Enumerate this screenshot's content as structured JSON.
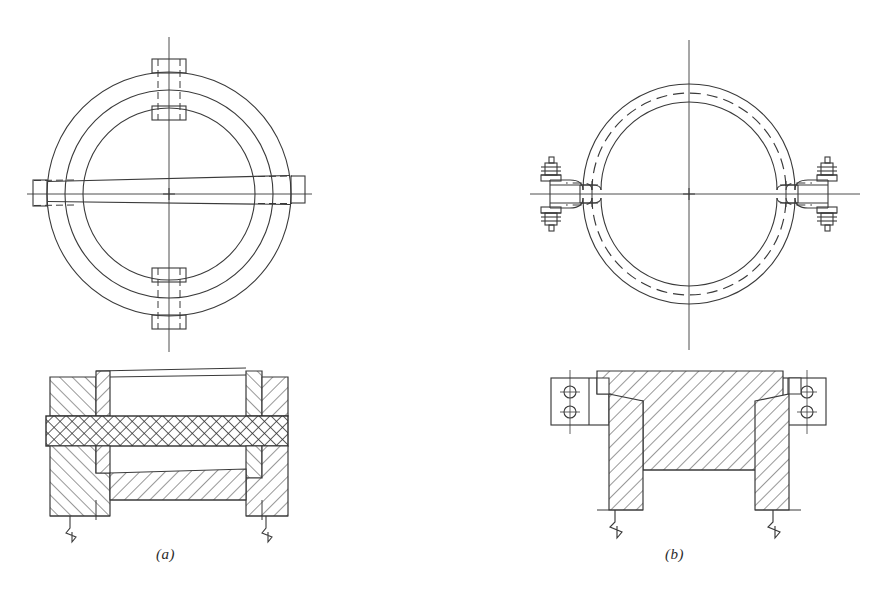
{
  "figure": {
    "background_color": "#ffffff",
    "ink_color": "#3a3a3a",
    "hatch_color": "#404040"
  },
  "captions": {
    "a": "(a)",
    "b": "(b)"
  },
  "panels": [
    {
      "id": "a",
      "caption": "(a)",
      "plan_view": {
        "name": "bolted-flange-plan",
        "center": [
          169,
          194
        ],
        "circles_radii": [
          122,
          104,
          86
        ],
        "lug_count": 4,
        "lug_positions": [
          "top",
          "bottom",
          "left",
          "right"
        ],
        "centerline_axes": [
          "vertical",
          "horizontal"
        ]
      },
      "section_view": {
        "name": "bolted-flange-section",
        "parts": [
          {
            "label": "left-flange-body",
            "hatch": "diagonal-up"
          },
          {
            "label": "right-flange-body",
            "hatch": "diagonal-up"
          },
          {
            "label": "gasket-strip",
            "hatch": "cross-hatch"
          },
          {
            "label": "lower-plate",
            "hatch": "diagonal-up"
          }
        ],
        "break_lines": 2
      }
    },
    {
      "id": "b",
      "caption": "(b)",
      "plan_view": {
        "name": "split-clamp-plan",
        "center": [
          689,
          194
        ],
        "circles_radii": [
          108,
          98,
          88
        ],
        "dashed_circle_radius": 98,
        "lug_count": 2,
        "lug_positions": [
          "left",
          "right"
        ],
        "bolts_per_lug": 2,
        "centerline_axes": [
          "vertical",
          "horizontal"
        ]
      },
      "section_view": {
        "name": "split-clamp-section",
        "parts": [
          {
            "label": "clamp-body",
            "hatch": "diagonal-up"
          },
          {
            "label": "left-leg",
            "hatch": "diagonal-up"
          },
          {
            "label": "right-leg",
            "hatch": "diagonal-up"
          },
          {
            "label": "left-bolt-lug-plate",
            "holes": 2
          },
          {
            "label": "right-bolt-lug-plate",
            "holes": 2
          }
        ],
        "break_lines": 2
      }
    }
  ]
}
